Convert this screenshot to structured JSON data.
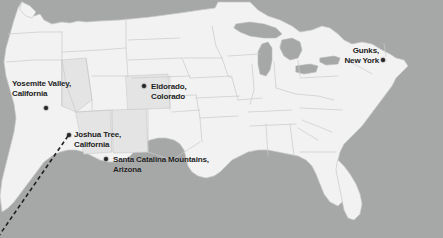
{
  "map": {
    "title": "United States climbing destinations map",
    "region": "Contiguous United States",
    "colors": {
      "ocean_background": "#a6a7a7",
      "land_fill": "#f2f2f2",
      "land_fill_shaded": "#e2e2e2",
      "border_stroke": "#c9c9c9",
      "marker_fill": "#262626",
      "label_color": "#1c1c1c",
      "route_line": "#1f1f1f"
    },
    "locations": [
      {
        "id": "yosemite-valley",
        "line1": "Yosemite Valley,",
        "line2": "California",
        "label_x": 12,
        "label_y": 79,
        "dot_x": 44,
        "dot_y": 106,
        "align": "left"
      },
      {
        "id": "eldorado-colorado",
        "line1": "Eldorado,",
        "line2": "Colorado",
        "label_x": 151,
        "label_y": 82,
        "dot_x": 142,
        "dot_y": 84,
        "align": "left"
      },
      {
        "id": "gunks-new-york",
        "line1": "Gunks,",
        "line2": "New York",
        "label_x": 337,
        "label_y": 46,
        "dot_x": 381,
        "dot_y": 58,
        "align": "right"
      },
      {
        "id": "joshua-tree-california",
        "line1": "Joshua Tree,",
        "line2": "California",
        "label_x": 74,
        "label_y": 130,
        "dot_x": 67,
        "dot_y": 133,
        "align": "left"
      },
      {
        "id": "santa-catalina-mountains",
        "line1": "Santa Catalina Mountains,",
        "line2": "Arizona",
        "label_x": 113,
        "label_y": 155,
        "dot_x": 104,
        "dot_y": 157,
        "align": "left"
      }
    ],
    "route": {
      "id": "joshua-tree-dashed-route",
      "from_x": 68,
      "from_y": 136,
      "to_x": -4,
      "to_y": 240,
      "dash": "4 3",
      "width": 1.6
    }
  }
}
